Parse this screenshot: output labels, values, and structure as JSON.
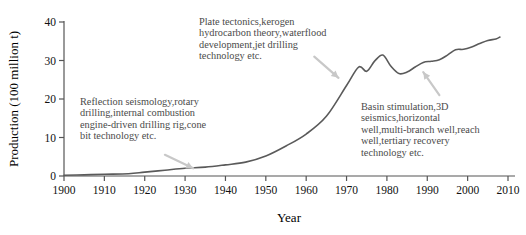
{
  "chart_data": {
    "type": "line",
    "title": "",
    "xlabel": "Year",
    "ylabel": "Production (100 million t)",
    "xlim": [
      1900,
      2010
    ],
    "ylim": [
      0,
      40
    ],
    "xticks": [
      1900,
      1910,
      1920,
      1930,
      1940,
      1950,
      1960,
      1970,
      1980,
      1990,
      2000,
      2010
    ],
    "yticks": [
      0,
      10,
      20,
      30,
      40
    ],
    "grid": false,
    "legend": null,
    "series": [
      {
        "name": "World oil production",
        "color": "#5a5a5a",
        "x": [
          1900,
          1905,
          1910,
          1916,
          1920,
          1925,
          1930,
          1935,
          1940,
          1945,
          1950,
          1955,
          1960,
          1965,
          1970,
          1973,
          1975,
          1977,
          1979,
          1981,
          1983,
          1985,
          1987,
          1989,
          1991,
          1993,
          1995,
          1997,
          1999,
          2001,
          2003,
          2005,
          2007,
          2008
        ],
        "y": [
          0.2,
          0.3,
          0.45,
          0.6,
          1.0,
          1.5,
          2.0,
          2.3,
          2.9,
          3.6,
          5.2,
          7.8,
          10.9,
          15.5,
          23.5,
          28.3,
          27.2,
          29.9,
          31.4,
          28.5,
          26.6,
          27.0,
          28.3,
          29.5,
          29.8,
          30.2,
          31.4,
          32.8,
          32.9,
          33.5,
          34.4,
          35.2,
          35.6,
          36.1
        ]
      }
    ],
    "annotations": [
      {
        "id": "annot-1",
        "text": "Reflection seismology,rotary\ndrilling,internal combustion\nengine-driven drilling rig,cone\nbit technology etc.",
        "arrow": {
          "from_x": 1925,
          "from_y": 5.5,
          "to_x": 1932,
          "to_y": 2.0
        }
      },
      {
        "id": "annot-2",
        "text": "Plate tectonics,kerogen\nhydrocarbon theory,waterflood\ndevelopment,jet drilling\ntechnology etc.",
        "arrow": {
          "from_x": 1962,
          "from_y": 31.0,
          "to_x": 1968,
          "to_y": 25.5
        }
      },
      {
        "id": "annot-3",
        "text": "Basin stimulation,3D\nseismics,horizontal\nwell,multi-branch well,reach\nwell,tertiary recovery\ntechnology etc.",
        "arrow": {
          "from_x": 1993,
          "from_y": 21.0,
          "to_x": 1989,
          "to_y": 27.0
        }
      }
    ],
    "colors": {
      "line": "#5a5a5a",
      "axis": "#555555",
      "annotation_text": "#4a4a4a",
      "arrow": "#c8c8c8"
    }
  },
  "axes": {
    "y_title": "Production (100 million t)",
    "x_title": "Year",
    "y_tick_labels": [
      "0",
      "10",
      "20",
      "30",
      "40"
    ],
    "x_tick_labels": [
      "1900",
      "1910",
      "1920",
      "1930",
      "1940",
      "1950",
      "1960",
      "1970",
      "1980",
      "1990",
      "2000",
      "2010"
    ]
  }
}
